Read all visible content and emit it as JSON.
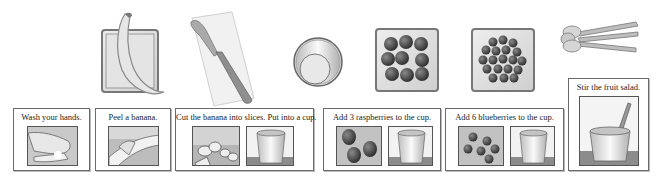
{
  "supplies": [
    {
      "name": "banana",
      "icon": "banana-on-plate-icon"
    },
    {
      "name": "knife",
      "icon": "knife-on-board-icon"
    },
    {
      "name": "cup",
      "icon": "cup-top-view-icon"
    },
    {
      "name": "raspberries",
      "icon": "raspberries-plate-icon"
    },
    {
      "name": "blueberries",
      "icon": "blueberries-plate-icon"
    },
    {
      "name": "spoons",
      "icon": "spoons-icon"
    }
  ],
  "steps": [
    {
      "label": "Wash your hands.",
      "images": [
        "washing-hands-icon"
      ]
    },
    {
      "label": "Peel a banana.",
      "images": [
        "peeling-banana-icon"
      ]
    },
    {
      "label": "Cut the banana into slices. Put into a cup.",
      "images": [
        "banana-slices-icon",
        "cup-icon"
      ]
    },
    {
      "label": "Add 3 raspberries to the cup.",
      "images": [
        "three-raspberries-icon",
        "cup-icon"
      ]
    },
    {
      "label": "Add 6 blueberries to the cup.",
      "images": [
        "six-blueberries-icon",
        "cup-icon"
      ]
    },
    {
      "label": "Stir the fruit salad.",
      "images": [
        "cup-with-spoon-icon"
      ]
    }
  ],
  "colors": {
    "border": "#6a6a6a",
    "picture_bg": "#c8c8c8",
    "table": "#8c8c8c",
    "berry_dark": "#3a3a3a"
  }
}
